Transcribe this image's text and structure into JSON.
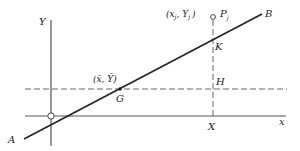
{
  "diagram": {
    "title": "",
    "axes": {
      "y_label": "Y",
      "x_label": "x"
    },
    "line": {
      "start_label": "A",
      "end_label": "B"
    },
    "centroid": {
      "coord_label": "(x̄, Ȳ)",
      "point_label": "G"
    },
    "observation": {
      "coord_label_open": "(x",
      "coord_sub_x": "j",
      "coord_sep": ", Y",
      "coord_sub_y": "j",
      "coord_close": ")",
      "point_label": "P",
      "point_sub": "j"
    },
    "points": {
      "intersection_line": "K",
      "intersection_mean": "H",
      "foot_on_axis": "X"
    },
    "colors": {
      "ink": "#222222",
      "axis": "#555555",
      "dashed": "#666666"
    }
  }
}
